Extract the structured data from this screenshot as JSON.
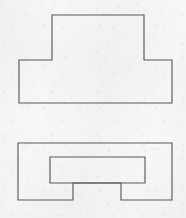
{
  "canvas": {
    "width": 186,
    "height": 218,
    "background_color": "#f7f7f5",
    "line_color": "#5a5a5a",
    "line_width": 1.15,
    "fill": "none",
    "description": "Two monochrome orthographic line drawings of stepped rectilinear outlines on lightly textured off-white paper. No text, labels, dimensions or annotations are present."
  },
  "figures": [
    {
      "id": "figure-top",
      "name": "tee-shape-with-two-feet",
      "shape_type": "rectilinear-polygon",
      "description": "Upper figure: a tall central rectangle rising from between two shorter rectangles, forming a symmetric stepped outline with a raised centre block and two lower flanking blocks separated by notches at the top.",
      "bounds": {
        "x": 19,
        "y": 15,
        "width": 153,
        "height": 88
      },
      "key_points": {
        "center_block_left": 52,
        "center_block_right": 144,
        "center_block_top": 15,
        "shoulder_y": 60,
        "left_block_left": 19,
        "left_block_right": 74,
        "right_block_left": 121,
        "right_block_right": 172,
        "baseline_y": 103
      },
      "vertices": [
        [
          52,
          15
        ],
        [
          144,
          15
        ],
        [
          144,
          60
        ],
        [
          172,
          60
        ],
        [
          172,
          103
        ],
        [
          19,
          103
        ],
        [
          19,
          60
        ],
        [
          52,
          60
        ]
      ]
    },
    {
      "id": "figure-bottom-outer",
      "name": "outer-stepped-block",
      "shape_type": "rectilinear-polygon",
      "description": "Lower figure outer outline: a wide rectangle whose lower edge is interrupted by a rectangular notch cut upward in the middle, leaving two legs at the bottom left and bottom right.",
      "bounds": {
        "x": 18,
        "y": 143,
        "width": 154,
        "height": 57
      },
      "key_points": {
        "outer_left": 18,
        "outer_right": 172,
        "outer_top": 143,
        "outer_bottom": 200,
        "notch_left": 73,
        "notch_right": 121,
        "notch_top_y": 183
      },
      "vertices": [
        [
          18,
          143
        ],
        [
          172,
          143
        ],
        [
          172,
          200
        ],
        [
          121,
          200
        ],
        [
          121,
          183
        ],
        [
          73,
          183
        ],
        [
          73,
          200
        ],
        [
          18,
          200
        ]
      ]
    },
    {
      "id": "figure-bottom-inner",
      "name": "inner-horizontal-rectangle",
      "shape_type": "rectangle",
      "description": "Lower figure inner outline: a horizontal rectangle drawn inside the outer block, its lower edge flush with the top of the bottom notch, overlapping the outer shape's interior.",
      "bounds": {
        "x": 50,
        "y": 157,
        "width": 95,
        "height": 26
      },
      "key_points": {
        "inner_left": 50,
        "inner_right": 145,
        "inner_top": 157,
        "inner_bottom": 183
      },
      "vertices": [
        [
          50,
          157
        ],
        [
          145,
          157
        ],
        [
          145,
          183
        ],
        [
          50,
          183
        ]
      ]
    }
  ]
}
